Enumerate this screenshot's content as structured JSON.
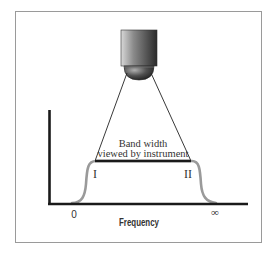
{
  "diagram": {
    "title_label": "Band width",
    "subtitle_label": "viewed by instrument",
    "region_left_label": "I",
    "region_right_label": "II",
    "x_axis_label": "Frequency",
    "x_tick_start": "0",
    "x_tick_end": "∞",
    "instrument": "camera-sensor",
    "colors": {
      "axis": "#1a1a1a",
      "curve": "#9a9a9a",
      "band_line": "#1a1a1a",
      "frame": "#9a9a9a",
      "text": "#333333"
    }
  }
}
